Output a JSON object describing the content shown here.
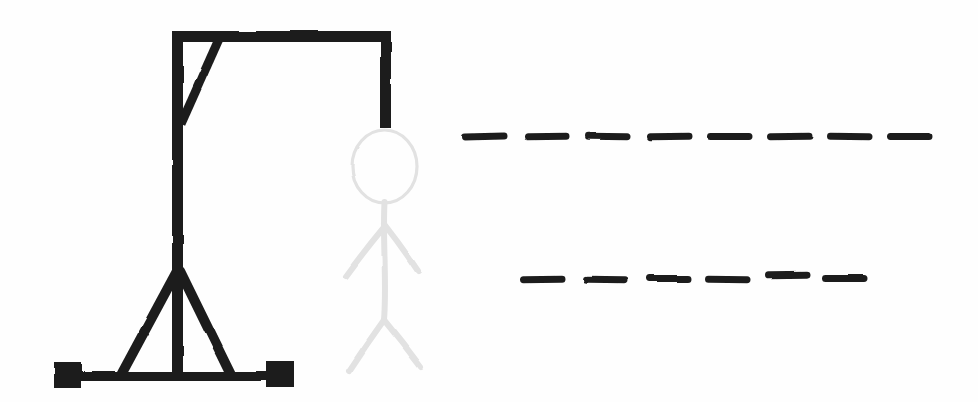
{
  "game": {
    "name": "hangman",
    "colors": {
      "ink": "#1f1f1f",
      "figure_faint": "#e2e2e2",
      "background": "#fefefe"
    },
    "gallows": {
      "drawn": true,
      "parts": [
        "left-foot",
        "right-foot",
        "base-bar",
        "left-support-leg",
        "right-support-leg",
        "post",
        "top-beam",
        "diagonal-brace",
        "rope"
      ]
    },
    "hanged_man": {
      "style": "faint-outline",
      "parts": [
        "head",
        "body",
        "left-arm",
        "right-arm",
        "left-leg",
        "right-leg"
      ]
    },
    "puzzle": {
      "rows": [
        {
          "word_index": 1,
          "letter_count": 8
        },
        {
          "word_index": 2,
          "letter_count": 6
        }
      ]
    }
  }
}
